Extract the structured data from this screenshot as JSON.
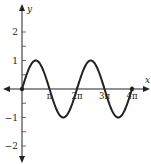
{
  "chart_data": {
    "type": "line",
    "title": "",
    "function": "y = sin(x)",
    "xlabel": "x",
    "ylabel": "y",
    "xlim": [
      0,
      12.566
    ],
    "ylim": [
      -2,
      2
    ],
    "x_ticks": [
      {
        "value": 3.1416,
        "label": "π"
      },
      {
        "value": 6.2832,
        "label": "2π"
      },
      {
        "value": 9.4248,
        "label": "3π"
      },
      {
        "value": 12.5664,
        "label": "4π"
      }
    ],
    "y_ticks": [
      {
        "value": 2,
        "label": "2"
      },
      {
        "value": 1,
        "label": "1"
      },
      {
        "value": -1,
        "label": "−1"
      },
      {
        "value": -2,
        "label": "−2"
      }
    ],
    "y_minor_ticks": [
      1.5,
      0.5,
      -0.5,
      -1.5
    ],
    "series": [
      {
        "name": "sin(x)",
        "x": [
          0,
          1.5708,
          3.1416,
          4.7124,
          6.2832,
          7.854,
          9.4248,
          10.9956,
          12.5664
        ],
        "values": [
          0,
          1,
          0,
          -1,
          0,
          1,
          0,
          -1,
          0
        ]
      }
    ],
    "endpoints": [
      {
        "x": 0,
        "y": 0
      },
      {
        "x": 12.5664,
        "y": 0
      }
    ],
    "grid": false,
    "legend": null
  }
}
